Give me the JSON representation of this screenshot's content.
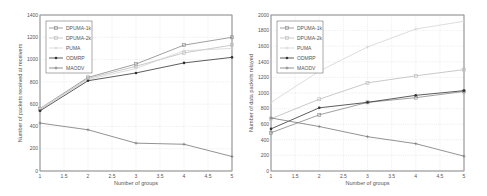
{
  "chart_data": [
    {
      "type": "line",
      "title": "",
      "xlabel": "Number of groups",
      "ylabel": "Number of packets received at receivers",
      "x": [
        1,
        2,
        3,
        4,
        5
      ],
      "xlim": [
        1,
        5
      ],
      "ylim": [
        0,
        1400
      ],
      "xticks": [
        "1",
        "1.5",
        "2",
        "2.5",
        "3",
        "3.5",
        "4",
        "4.5",
        "5"
      ],
      "yticks": [
        "0",
        "200",
        "400",
        "600",
        "800",
        "1000",
        "1200",
        "1400"
      ],
      "grid": true,
      "legend_position": "upper left",
      "series": [
        {
          "name": "DPUMA-1k",
          "values": [
            560,
            840,
            960,
            1130,
            1200
          ],
          "color": "#888888",
          "marker": "square"
        },
        {
          "name": "DPUMA-2k",
          "values": [
            550,
            830,
            940,
            1060,
            1130
          ],
          "color": "#bbbbbb",
          "marker": "square"
        },
        {
          "name": "PUMA",
          "values": [
            560,
            820,
            920,
            1080,
            1100
          ],
          "color": "#d4d4d4",
          "marker": "plus"
        },
        {
          "name": "ODMRP",
          "values": [
            540,
            810,
            880,
            970,
            1020
          ],
          "color": "#333333",
          "marker": "dot"
        },
        {
          "name": "MAODV",
          "values": [
            430,
            370,
            250,
            240,
            130
          ],
          "color": "#777777",
          "marker": "plus"
        }
      ]
    },
    {
      "type": "line",
      "title": "",
      "xlabel": "Number of groups",
      "ylabel": "Number of data packets relayed",
      "x": [
        1,
        2,
        3,
        4,
        5
      ],
      "xlim": [
        1,
        5
      ],
      "ylim": [
        0,
        2000
      ],
      "xticks": [
        "1",
        "1.5",
        "2",
        "2.5",
        "3",
        "3.5",
        "4",
        "4.5",
        "5"
      ],
      "yticks": [
        "0",
        "200",
        "400",
        "600",
        "800",
        "1000",
        "1200",
        "1400",
        "1600",
        "1800",
        "2000"
      ],
      "grid": true,
      "legend_position": "upper left",
      "series": [
        {
          "name": "DPUMA-1k",
          "values": [
            490,
            720,
            880,
            940,
            1020
          ],
          "color": "#888888",
          "marker": "square"
        },
        {
          "name": "DPUMA-2k",
          "values": [
            670,
            920,
            1130,
            1220,
            1300
          ],
          "color": "#bbbbbb",
          "marker": "square"
        },
        {
          "name": "PUMA",
          "values": [
            880,
            1280,
            1590,
            1820,
            1920
          ],
          "color": "#d4d4d4",
          "marker": "plus"
        },
        {
          "name": "ODMRP",
          "values": [
            540,
            810,
            880,
            970,
            1030
          ],
          "color": "#333333",
          "marker": "dot"
        },
        {
          "name": "MAODV",
          "values": [
            680,
            570,
            440,
            350,
            190
          ],
          "color": "#777777",
          "marker": "plus"
        }
      ]
    }
  ]
}
